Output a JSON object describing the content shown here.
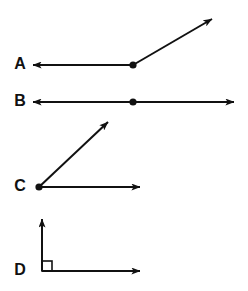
{
  "figure": {
    "background_color": "#ffffff",
    "stroke_color": "#111111",
    "label_color": "#111111"
  },
  "items": [
    {
      "label": "A",
      "label_x": 20,
      "label_y": 65,
      "type": "obtuse-angle",
      "vertex": {
        "x": 133,
        "y": 65,
        "dot_radius": 3.6
      },
      "rays": [
        {
          "name": "ray-left",
          "x1": 133,
          "y1": 65,
          "x2": 33,
          "y2": 65,
          "arrow": true
        },
        {
          "name": "ray-upper-right",
          "x1": 133,
          "y1": 65,
          "x2": 212,
          "y2": 19,
          "arrow": true
        }
      ],
      "right_angle_mark": null
    },
    {
      "label": "B",
      "label_x": 20,
      "label_y": 102,
      "type": "straight-angle",
      "vertex": {
        "x": 133,
        "y": 102,
        "dot_radius": 3.6
      },
      "rays": [
        {
          "name": "ray-left",
          "x1": 133,
          "y1": 102,
          "x2": 33,
          "y2": 102,
          "arrow": true
        },
        {
          "name": "ray-right",
          "x1": 133,
          "y1": 102,
          "x2": 234,
          "y2": 102,
          "arrow": true
        }
      ],
      "right_angle_mark": null
    },
    {
      "label": "C",
      "label_x": 20,
      "label_y": 187,
      "type": "acute-angle",
      "vertex": {
        "x": 39,
        "y": 187,
        "dot_radius": 3.6
      },
      "rays": [
        {
          "name": "ray-right",
          "x1": 39,
          "y1": 187,
          "x2": 140,
          "y2": 187,
          "arrow": true
        },
        {
          "name": "ray-upper-right",
          "x1": 39,
          "y1": 187,
          "x2": 108,
          "y2": 122,
          "arrow": true
        }
      ],
      "right_angle_mark": null
    },
    {
      "label": "D",
      "label_x": 20,
      "label_y": 271,
      "type": "right-angle",
      "vertex": {
        "x": 42,
        "y": 271,
        "dot_radius": 0
      },
      "rays": [
        {
          "name": "ray-right",
          "x1": 42,
          "y1": 271,
          "x2": 140,
          "y2": 271,
          "arrow": true
        },
        {
          "name": "ray-up",
          "x1": 42,
          "y1": 271,
          "x2": 42,
          "y2": 219,
          "arrow": true
        }
      ],
      "right_angle_mark": {
        "x": 42,
        "y": 261,
        "size": 10
      }
    }
  ]
}
